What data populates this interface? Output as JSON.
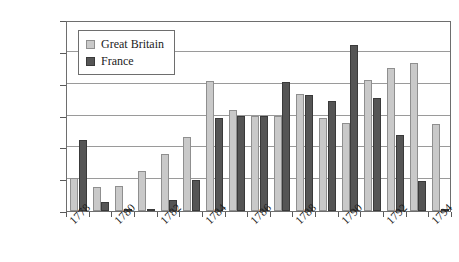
{
  "chart_data": {
    "type": "bar",
    "title": "",
    "subtitle": "",
    "xlabel": "",
    "ylabel": "",
    "ylim": [
      0,
      60000
    ],
    "ytick_values": [
      0,
      10000,
      20000,
      30000,
      40000,
      50000,
      60000
    ],
    "ytick_labels": [
      "0",
      "10,000",
      "20,000",
      "30,000",
      "40,000",
      "50,000",
      "60,000"
    ],
    "grid": true,
    "legend_position": "upper-left-inside",
    "categories": [
      "1778",
      "1779",
      "1780",
      "1781",
      "1782",
      "1783",
      "1784",
      "1785",
      "1786",
      "1787",
      "1788",
      "1789",
      "1790",
      "1791",
      "1792",
      "1793",
      "1794"
    ],
    "xtick_labels_shown": [
      "1778",
      "1780",
      "1782",
      "1784",
      "1786",
      "1788",
      "1790",
      "1792",
      "1794"
    ],
    "series": [
      {
        "name": "Great Britain",
        "color": "#c9c9c9",
        "values": [
          10500,
          7500,
          7800,
          12700,
          18000,
          23200,
          40700,
          31700,
          29800,
          30000,
          36800,
          29300,
          27500,
          41300,
          45000,
          46600,
          27200
        ]
      },
      {
        "name": "France",
        "color": "#555555",
        "values": [
          22200,
          2800,
          200,
          600,
          3400,
          9900,
          29300,
          29800,
          29700,
          40600,
          36500,
          34600,
          52000,
          35400,
          24000,
          9500,
          400
        ]
      }
    ]
  },
  "legend": {
    "items": [
      {
        "label": "Great Britain",
        "key": "gb"
      },
      {
        "label": "France",
        "key": "fr"
      }
    ]
  }
}
